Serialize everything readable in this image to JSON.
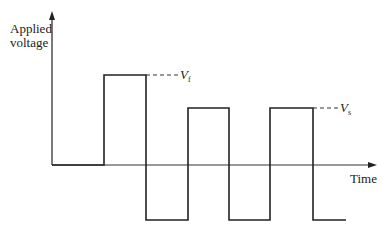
{
  "diagram": {
    "y_axis_label_line1": "Applied",
    "y_axis_label_line2": "voltage",
    "x_axis_label": "Time",
    "forward_voltage_label": "V",
    "forward_voltage_subscript": "f",
    "steady_voltage_label": "V",
    "steady_voltage_subscript": "s",
    "waveform": {
      "description": "Square-wave applied voltage vs time: an initial forward pulse of height Vf, followed by alternating negative and positive pulses of height Vs",
      "baseline_y": 165,
      "segments": [
        {
          "type": "zero",
          "t_start": 52,
          "t_end": 104
        },
        {
          "type": "positive",
          "level": "Vf",
          "t_start": 104,
          "t_end": 146
        },
        {
          "type": "negative",
          "t_start": 146,
          "t_end": 188
        },
        {
          "type": "positive",
          "level": "Vs",
          "t_start": 188,
          "t_end": 229
        },
        {
          "type": "negative",
          "t_start": 229,
          "t_end": 270
        },
        {
          "type": "positive",
          "level": "Vs",
          "t_start": 270,
          "t_end": 313
        },
        {
          "type": "negative",
          "t_start": 313,
          "t_end": 346
        }
      ]
    },
    "colors": {
      "line": "#222222",
      "background": "#ffffff"
    }
  }
}
